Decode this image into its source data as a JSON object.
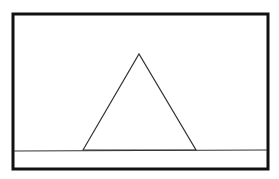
{
  "diagram": {
    "colors": {
      "background": "#ffffff",
      "frame_stroke": "#111111",
      "line_stroke": "#333333"
    },
    "frame": {
      "x": 13,
      "y": 14,
      "width": 255,
      "height": 155,
      "stroke_width": 3
    },
    "ground_line": {
      "x1": 14,
      "y1": 151,
      "x2": 267,
      "y2": 150
    },
    "triangle": {
      "apex": [
        139,
        54
      ],
      "base_left": [
        83,
        150
      ],
      "base_right": [
        196,
        150
      ]
    }
  }
}
